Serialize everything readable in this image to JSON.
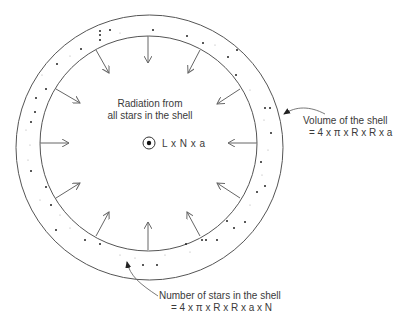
{
  "diagram": {
    "shell": {
      "outer_radius_label": "R + a",
      "inner_radius_label": "R"
    },
    "center_label": "L x N x a",
    "radiation_label": {
      "line1": "Radiation from",
      "line2": "all stars in the shell"
    },
    "volume_label": {
      "line1": "Volume of the shell",
      "line2": "= 4 x π x R x R x a"
    },
    "stars_label": {
      "line1": "Number of stars in the shell",
      "line2": "= 4 x π x R x R x a x N"
    },
    "colors": {
      "line": "#555555",
      "arrow": "#666666",
      "dot": "#222222",
      "text": "#3a3a3a"
    },
    "arrow_count": 14
  }
}
